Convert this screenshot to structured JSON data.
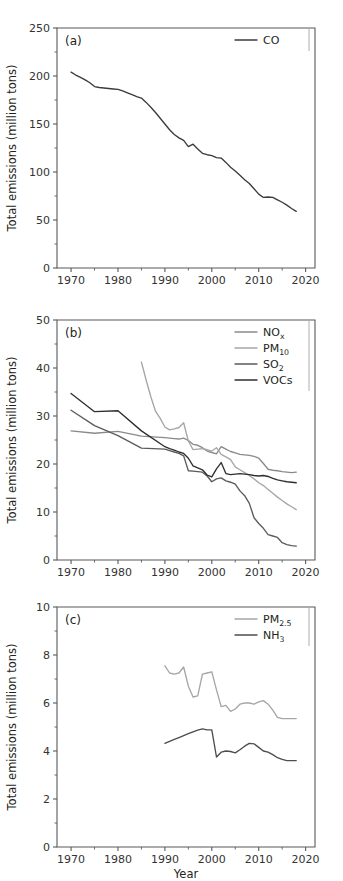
{
  "figure": {
    "background": "#ffffff",
    "xlabel": "Year",
    "ylabel": "Total emissions (million tons)",
    "panel_tags": [
      "(a)",
      "(b)",
      "(c)"
    ]
  },
  "chart_data": [
    {
      "type": "line",
      "panel": "(a)",
      "title": "",
      "xlabel": "",
      "ylabel": "Total emissions (million tons)",
      "xlim": [
        1967,
        2022
      ],
      "ylim": [
        0,
        250
      ],
      "xticks": [
        1970,
        1980,
        1990,
        2000,
        2010,
        2020
      ],
      "yticks": [
        0,
        50,
        100,
        150,
        200,
        250
      ],
      "grid": false,
      "legend_position": "top-right",
      "series": [
        {
          "name": "CO",
          "color": "#3b3b3b",
          "x": [
            1970,
            1971,
            1972,
            1973,
            1974,
            1975,
            1976,
            1977,
            1978,
            1979,
            1980,
            1981,
            1982,
            1983,
            1984,
            1985,
            1986,
            1987,
            1988,
            1989,
            1990,
            1991,
            1992,
            1993,
            1994,
            1995,
            1996,
            1997,
            1998,
            1999,
            2000,
            2001,
            2002,
            2003,
            2004,
            2005,
            2006,
            2007,
            2008,
            2009,
            2010,
            2011,
            2012,
            2013,
            2014,
            2015,
            2016,
            2017,
            2018
          ],
          "values": [
            204.0,
            201.0,
            198.5,
            196.0,
            193.0,
            189.0,
            188.0,
            187.5,
            187.0,
            186.5,
            186.0,
            184.5,
            182.5,
            180.5,
            178.5,
            177.0,
            172.5,
            167.5,
            162.0,
            156.0,
            150.0,
            144.0,
            139.0,
            135.5,
            133.0,
            126.5,
            129.0,
            124.0,
            119.5,
            118.0,
            117.0,
            115.0,
            114.5,
            110.0,
            105.0,
            101.0,
            96.5,
            92.0,
            88.0,
            82.5,
            77.0,
            73.5,
            74.0,
            73.5,
            71.0,
            68.5,
            65.5,
            62.0,
            59.0
          ]
        }
      ]
    },
    {
      "type": "line",
      "panel": "(b)",
      "title": "",
      "xlabel": "",
      "ylabel": "Total emissions (million tons)",
      "xlim": [
        1967,
        2022
      ],
      "ylim": [
        0,
        50
      ],
      "xticks": [
        1970,
        1980,
        1990,
        2000,
        2010,
        2020
      ],
      "yticks": [
        0,
        10,
        20,
        30,
        40,
        50
      ],
      "grid": false,
      "legend_position": "top-right",
      "series": [
        {
          "name": "NOx",
          "label_main": "NO",
          "label_sub": "x",
          "color": "#8a8a8a",
          "x": [
            1970,
            1975,
            1980,
            1985,
            1990,
            1991,
            1992,
            1993,
            1994,
            1995,
            1996,
            1997,
            1998,
            1999,
            2000,
            2001,
            2002,
            2003,
            2004,
            2005,
            2006,
            2007,
            2008,
            2009,
            2010,
            2011,
            2012,
            2013,
            2014,
            2015,
            2016,
            2017,
            2018
          ],
          "values": [
            26.9,
            26.4,
            26.8,
            25.8,
            25.5,
            25.4,
            25.3,
            25.2,
            25.4,
            24.9,
            24.1,
            23.9,
            23.4,
            22.7,
            22.4,
            22.1,
            23.6,
            23.1,
            22.6,
            22.3,
            22.0,
            21.9,
            21.8,
            21.6,
            21.2,
            20.1,
            18.9,
            18.7,
            18.6,
            18.4,
            18.3,
            18.2,
            18.3
          ]
        },
        {
          "name": "PM10",
          "label_main": "PM",
          "label_sub": "10",
          "color": "#a6a6a6",
          "x": [
            1985,
            1986,
            1987,
            1988,
            1989,
            1990,
            1991,
            1992,
            1993,
            1994,
            1995,
            1996,
            1997,
            1998,
            1999,
            2000,
            2001,
            2002,
            2003,
            2004,
            2005,
            2006,
            2007,
            2008,
            2009,
            2010,
            2011,
            2012,
            2013,
            2014,
            2015,
            2016,
            2017,
            2018
          ],
          "values": [
            41.2,
            37.5,
            34.0,
            31.0,
            29.5,
            27.7,
            27.1,
            27.3,
            27.6,
            28.6,
            24.8,
            23.0,
            23.1,
            23.2,
            23.0,
            22.7,
            23.4,
            22.0,
            21.5,
            20.9,
            19.4,
            18.8,
            18.2,
            17.6,
            16.9,
            16.1,
            15.5,
            14.7,
            13.9,
            13.1,
            12.4,
            11.7,
            11.1,
            10.5
          ]
        },
        {
          "name": "SO2",
          "label_main": "SO",
          "label_sub": "2",
          "color": "#5b5b5b",
          "x": [
            1970,
            1975,
            1980,
            1985,
            1990,
            1991,
            1992,
            1993,
            1994,
            1995,
            1996,
            1997,
            1998,
            1999,
            2000,
            2001,
            2002,
            2003,
            2004,
            2005,
            2006,
            2007,
            2008,
            2009,
            2010,
            2011,
            2012,
            2013,
            2014,
            2015,
            2016,
            2017,
            2018
          ],
          "values": [
            31.2,
            28.0,
            25.9,
            23.3,
            23.1,
            22.8,
            22.5,
            22.2,
            21.7,
            18.6,
            18.5,
            18.4,
            18.3,
            17.5,
            16.3,
            16.9,
            17.1,
            16.5,
            16.2,
            15.8,
            14.4,
            13.4,
            11.8,
            8.8,
            7.6,
            6.6,
            5.3,
            5.0,
            4.7,
            3.6,
            3.2,
            3.0,
            2.9
          ]
        },
        {
          "name": "VOCs",
          "label_main": "VOCs",
          "label_sub": "",
          "color": "#2f2f2f",
          "x": [
            1970,
            1975,
            1980,
            1985,
            1990,
            1991,
            1992,
            1993,
            1994,
            1995,
            1996,
            1997,
            1998,
            1999,
            2000,
            2001,
            2002,
            2003,
            2004,
            2005,
            2006,
            2007,
            2008,
            2009,
            2010,
            2011,
            2012,
            2013,
            2014,
            2015,
            2016,
            2017,
            2018
          ],
          "values": [
            34.7,
            30.9,
            31.1,
            26.9,
            23.6,
            23.2,
            22.9,
            22.5,
            22.2,
            21.2,
            19.6,
            19.2,
            18.8,
            17.7,
            17.3,
            19.0,
            20.3,
            18.0,
            17.8,
            17.9,
            18.0,
            17.9,
            17.8,
            17.6,
            17.5,
            17.6,
            17.4,
            17.0,
            16.7,
            16.5,
            16.3,
            16.2,
            16.1
          ]
        }
      ]
    },
    {
      "type": "line",
      "panel": "(c)",
      "title": "",
      "xlabel": "Year",
      "ylabel": "Total emissions (million tons)",
      "xlim": [
        1967,
        2022
      ],
      "ylim": [
        0,
        10
      ],
      "xticks": [
        1970,
        1980,
        1990,
        2000,
        2010,
        2020
      ],
      "yticks": [
        0,
        2,
        4,
        6,
        8,
        10
      ],
      "grid": false,
      "legend_position": "top-right",
      "series": [
        {
          "name": "PM2.5",
          "label_main": "PM",
          "label_sub": "2.5",
          "color": "#a6a6a6",
          "x": [
            1990,
            1991,
            1992,
            1993,
            1994,
            1995,
            1996,
            1997,
            1998,
            1999,
            2000,
            2001,
            2002,
            2003,
            2004,
            2005,
            2006,
            2007,
            2008,
            2009,
            2010,
            2011,
            2012,
            2013,
            2014,
            2015,
            2016,
            2017,
            2018
          ],
          "values": [
            7.55,
            7.25,
            7.2,
            7.25,
            7.5,
            6.7,
            6.25,
            6.3,
            7.2,
            7.25,
            7.3,
            6.55,
            5.85,
            5.9,
            5.65,
            5.75,
            5.95,
            6.0,
            6.0,
            5.95,
            6.05,
            6.1,
            5.95,
            5.7,
            5.4,
            5.35,
            5.35,
            5.35,
            5.35
          ]
        },
        {
          "name": "NH3",
          "label_main": "NH",
          "label_sub": "3",
          "color": "#4d4d4d",
          "x": [
            1990,
            1991,
            1992,
            1993,
            1994,
            1995,
            1996,
            1997,
            1998,
            1999,
            2000,
            2001,
            2002,
            2003,
            2004,
            2005,
            2006,
            2007,
            2008,
            2009,
            2010,
            2011,
            2012,
            2013,
            2014,
            2015,
            2016,
            2017,
            2018
          ],
          "values": [
            4.32,
            4.4,
            4.48,
            4.56,
            4.64,
            4.72,
            4.8,
            4.87,
            4.92,
            4.88,
            4.88,
            3.75,
            3.95,
            4.0,
            3.98,
            3.92,
            4.05,
            4.2,
            4.32,
            4.3,
            4.15,
            4.0,
            3.95,
            3.85,
            3.72,
            3.65,
            3.6,
            3.6,
            3.6
          ]
        }
      ]
    }
  ]
}
